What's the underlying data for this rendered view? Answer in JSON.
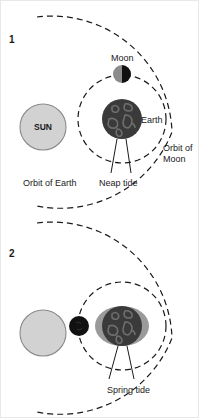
{
  "figure": {
    "background_color": "#ffffff",
    "width": 199,
    "height": 418
  },
  "colors": {
    "sun_fill": "#d2d2d2",
    "sun_stroke": "#8a8a8a",
    "earth_fill": "#3a3a3a",
    "earth_continent": "#6e6e6e",
    "moon_light": "#8c8c8c",
    "moon_dark": "#111111",
    "moon_new": "#111111",
    "tidal_bulge": "#9a9a9a",
    "line": "#1a1a1a",
    "text": "#1a1a1a"
  },
  "panels": [
    {
      "number": "1",
      "tide_type": "Neap tide",
      "moon_phase": "half-moon",
      "labels": {
        "sun": "SUN",
        "moon": "Moon",
        "earth": "Earth",
        "orbit_of_moon_line1": "Orbit of",
        "orbit_of_moon_line2": "Moon",
        "orbit_of_earth": "Orbit of Earth",
        "tide": "Neap tide"
      }
    },
    {
      "number": "2",
      "tide_type": "Spring tide",
      "moon_phase": "new-moon",
      "labels": {
        "tide": "Spring tide"
      }
    }
  ]
}
